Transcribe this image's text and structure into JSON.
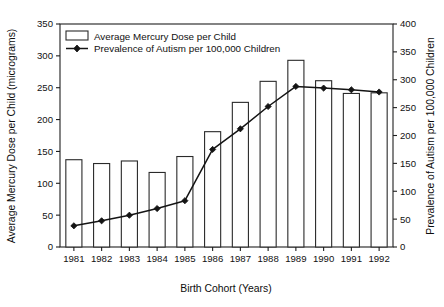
{
  "chart_data": {
    "type": "bar",
    "title": "",
    "xlabel": "Birth Cohort (Years)",
    "ylabel": "Average Mercury Dose per Child (micrograms)",
    "y2label": "Prevalence of Autism per 100,000 Children",
    "categories": [
      "1981",
      "1982",
      "1983",
      "1984",
      "1985",
      "1986",
      "1987",
      "1988",
      "1989",
      "1990",
      "1991",
      "1992"
    ],
    "ylim": [
      0,
      350
    ],
    "y2lim": [
      0,
      400
    ],
    "yticks": [
      0,
      50,
      100,
      150,
      200,
      250,
      300,
      350
    ],
    "y2ticks": [
      0,
      50,
      100,
      150,
      200,
      250,
      300,
      350,
      400
    ],
    "grid": false,
    "legend_position": "upper-left",
    "series": [
      {
        "name": "Average Mercury Dose per Child",
        "kind": "bar",
        "axis": "left",
        "units": "micrograms",
        "values": [
          137,
          131,
          135,
          117,
          142,
          181,
          227,
          260,
          293,
          261,
          241,
          242
        ]
      },
      {
        "name": "Prevalence of Autism per 100,000 Children",
        "kind": "line",
        "axis": "right",
        "marker": "diamond",
        "values": [
          38,
          47,
          57,
          69,
          83,
          175,
          212,
          252,
          288,
          285,
          282,
          278
        ]
      }
    ]
  },
  "legend": {
    "entries": [
      {
        "label": "Average Mercury Dose per Child",
        "glyph": "bar-swatch-icon"
      },
      {
        "label": "Prevalence of Autism per 100,000 Children",
        "glyph": "line-marker-icon"
      }
    ]
  }
}
